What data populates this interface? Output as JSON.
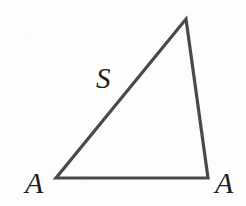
{
  "figure": {
    "kind": "geometry-diagram",
    "width": 246,
    "height": 206,
    "background_color": "#fdfdfd",
    "stroke_color": "#4a4a4a",
    "label_color": "#1f1f1f",
    "stroke_width": 3.2
  },
  "shape": {
    "name": "triangle",
    "vertices": [
      {
        "id": "apex",
        "x": 186,
        "y": 19
      },
      {
        "id": "bottom-right",
        "x": 208,
        "y": 178
      },
      {
        "id": "bottom-left",
        "x": 56,
        "y": 178
      }
    ],
    "points_attr": "186,19 208,178 56,178",
    "edges": [
      {
        "id": "hypotenuse",
        "from": "bottom-left",
        "to": "apex",
        "label": "S"
      },
      {
        "id": "right-side",
        "from": "apex",
        "to": "bottom-right",
        "label": ""
      },
      {
        "id": "base",
        "from": "bottom-left",
        "to": "bottom-right",
        "label": ""
      }
    ]
  },
  "labels": {
    "angle_left": "A",
    "angle_right": "A",
    "side_s": "S"
  }
}
